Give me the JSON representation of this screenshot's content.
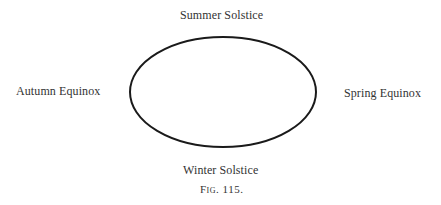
{
  "figure": {
    "caption": "Fig. 115.",
    "labels": {
      "top": "Summer Solstice",
      "bottom": "Winter Solstice",
      "left": "Autumn Equinox",
      "right": "Spring Equinox"
    },
    "orbit": {
      "shape": "ellipse",
      "cx": 223,
      "cy": 92,
      "rx": 94,
      "ry": 55,
      "stroke": "#1a1a1a"
    }
  }
}
